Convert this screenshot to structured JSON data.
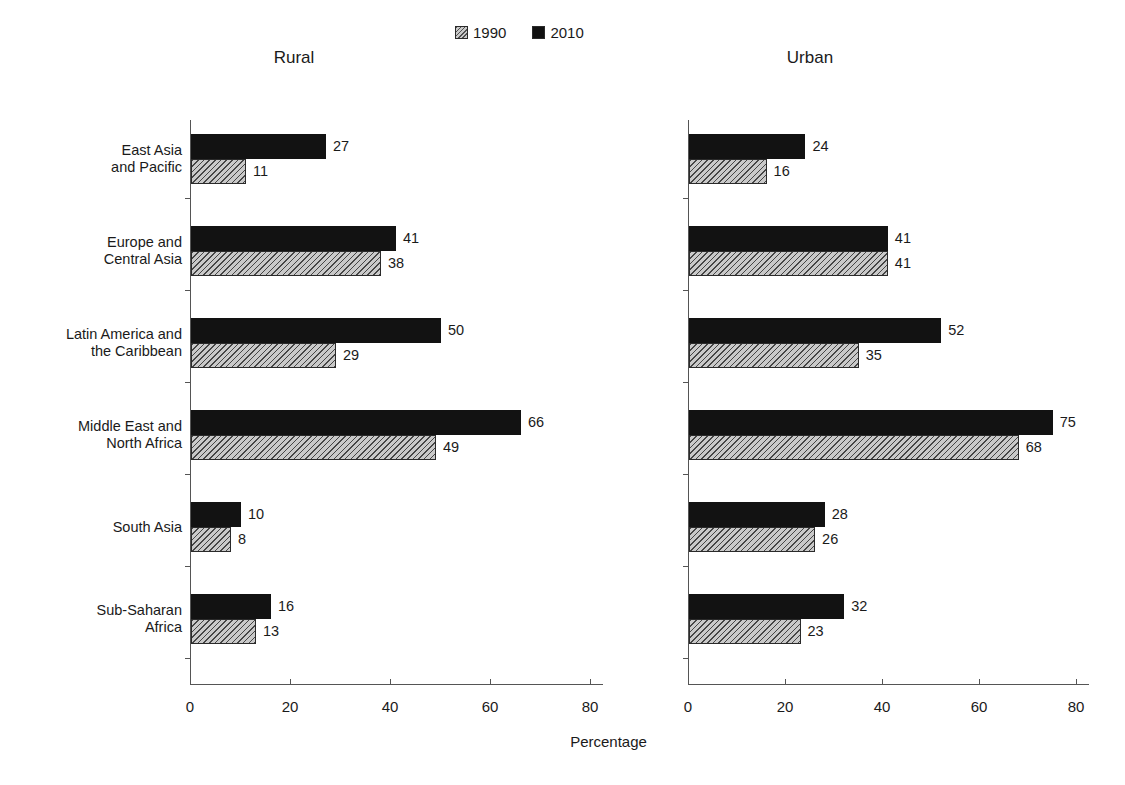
{
  "legend": {
    "entries": [
      {
        "label": "1990",
        "swatch": "hatched-gray-swatch",
        "color": "#c9c9c9"
      },
      {
        "label": "2010",
        "swatch": "solid-black-swatch",
        "color": "#121212"
      }
    ]
  },
  "panels": {
    "left_title": "Rural",
    "right_title": "Urban"
  },
  "axis_title": "Percentage",
  "chart_data": {
    "type": "bar",
    "orientation": "horizontal",
    "title": "",
    "subtitle": "",
    "xlabel": "Percentage",
    "ylabel": "",
    "xlim": [
      0,
      80
    ],
    "xticks": [
      0,
      20,
      40,
      60,
      80
    ],
    "xtick_labels": [
      "0",
      "20",
      "40",
      "60",
      "80"
    ],
    "grid": false,
    "legend_position": "top-center",
    "categories": [
      "East Asia\nand Pacific",
      "Europe and\nCentral Asia",
      "Latin America and\nthe Caribbean",
      "Middle East and\nNorth Africa",
      "South Asia",
      "Sub-Saharan\nAfrica"
    ],
    "panels": [
      {
        "name": "Rural",
        "series": [
          {
            "name": "1990",
            "values": [
              11,
              38,
              29,
              49,
              8,
              13
            ]
          },
          {
            "name": "2010",
            "values": [
              27,
              41,
              50,
              66,
              10,
              16
            ]
          }
        ]
      },
      {
        "name": "Urban",
        "series": [
          {
            "name": "1990",
            "values": [
              16,
              41,
              35,
              68,
              26,
              23
            ]
          },
          {
            "name": "2010",
            "values": [
              24,
              41,
              52,
              75,
              28,
              32
            ]
          }
        ]
      }
    ]
  }
}
